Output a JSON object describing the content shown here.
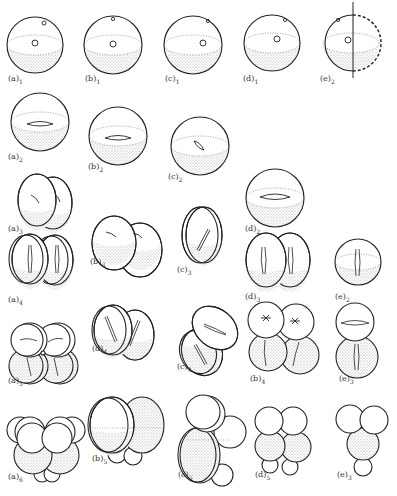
{
  "figure": {
    "labels": [
      {
        "id": "a1",
        "text": "(a)",
        "sub": "1",
        "x": 8,
        "y": 82
      },
      {
        "id": "b1",
        "text": "(b)",
        "sub": "1",
        "x": 85,
        "y": 82
      },
      {
        "id": "c1",
        "text": "(c)",
        "sub": "1",
        "x": 165,
        "y": 82
      },
      {
        "id": "d1",
        "text": "(d)",
        "sub": "1",
        "x": 243,
        "y": 82
      },
      {
        "id": "e1",
        "text": "(e)",
        "sub": "2",
        "x": 320,
        "y": 82
      },
      {
        "id": "a2",
        "text": "(a)",
        "sub": "2",
        "x": 8,
        "y": 160
      },
      {
        "id": "b2",
        "text": "(b)",
        "sub": "2",
        "x": 88,
        "y": 170
      },
      {
        "id": "c2",
        "text": "(c)",
        "sub": "2",
        "x": 168,
        "y": 180
      },
      {
        "id": "a3",
        "text": "(a)",
        "sub": "3",
        "x": 8,
        "y": 232
      },
      {
        "id": "d2",
        "text": "(d)",
        "sub": "2",
        "x": 245,
        "y": 232
      },
      {
        "id": "b3",
        "text": "(b)",
        "sub": "3",
        "x": 90,
        "y": 265
      },
      {
        "id": "c3",
        "text": "(c)",
        "sub": "3",
        "x": 177,
        "y": 273
      },
      {
        "id": "a4",
        "text": "(a)",
        "sub": "4",
        "x": 8,
        "y": 303
      },
      {
        "id": "d3",
        "text": "(d)",
        "sub": "3",
        "x": 245,
        "y": 300
      },
      {
        "id": "e2",
        "text": "(e)",
        "sub": "2",
        "x": 335,
        "y": 300
      },
      {
        "id": "d4",
        "text": "(d)",
        "sub": "4",
        "x": 92,
        "y": 352
      },
      {
        "id": "c4",
        "text": "(c)",
        "sub": "4",
        "x": 177,
        "y": 370
      },
      {
        "id": "a5",
        "text": "(a)",
        "sub": "5",
        "x": 8,
        "y": 384
      },
      {
        "id": "b4",
        "text": "(b)",
        "sub": "4",
        "x": 250,
        "y": 382
      },
      {
        "id": "e3a",
        "text": "(e)",
        "sub": "3",
        "x": 339,
        "y": 382
      },
      {
        "id": "a6",
        "text": "(a)",
        "sub": "6",
        "x": 8,
        "y": 480
      },
      {
        "id": "b5",
        "text": "(b)",
        "sub": "5",
        "x": 92,
        "y": 462
      },
      {
        "id": "c5",
        "text": "(c)",
        "sub": "5",
        "x": 178,
        "y": 478
      },
      {
        "id": "d5",
        "text": "(d)",
        "sub": "5",
        "x": 255,
        "y": 478
      },
      {
        "id": "e3b",
        "text": "(e)",
        "sub": "3",
        "x": 337,
        "y": 478
      }
    ]
  },
  "colors": {
    "stroke": "#222222",
    "stipple": "#bdbdbd",
    "background": "#ffffff"
  }
}
